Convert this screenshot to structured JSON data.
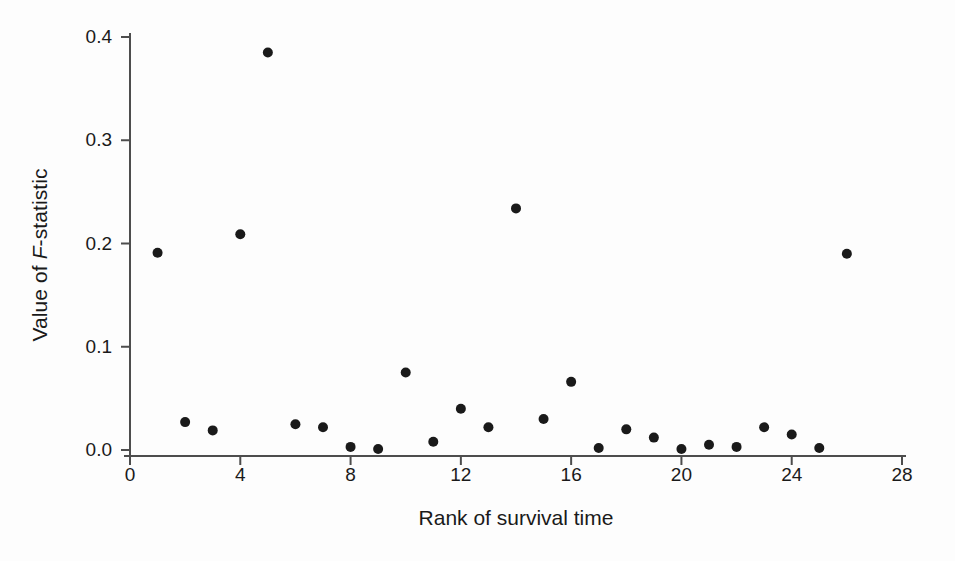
{
  "chart_data": {
    "type": "scatter",
    "title": "",
    "xlabel": "Rank of survival time",
    "ylabel": "Value of F-statistic",
    "ylabel_parts": {
      "prefix": "Value of ",
      "italic": "F",
      "suffix": "-statistic"
    },
    "xlim": [
      0,
      28
    ],
    "ylim": [
      0.0,
      0.4
    ],
    "xticks": [
      0,
      4,
      8,
      12,
      16,
      20,
      24,
      28
    ],
    "xtick_labels": [
      "0",
      "4",
      "8",
      "12",
      "16",
      "20",
      "24",
      "28"
    ],
    "yticks": [
      0.0,
      0.1,
      0.2,
      0.3,
      0.4
    ],
    "ytick_labels": [
      "0.0",
      "0.1",
      "0.2",
      "0.3",
      "0.4"
    ],
    "grid": false,
    "legend": false,
    "marker": {
      "shape": "circle",
      "color": "#1a1a1a",
      "size_px": 10
    },
    "x": [
      1,
      2,
      3,
      4,
      5,
      6,
      7,
      8,
      9,
      10,
      11,
      12,
      13,
      14,
      15,
      16,
      17,
      18,
      19,
      20,
      21,
      22,
      23,
      24,
      25,
      26
    ],
    "values": [
      0.191,
      0.027,
      0.019,
      0.209,
      0.385,
      0.025,
      0.022,
      0.003,
      0.001,
      0.075,
      0.008,
      0.04,
      0.022,
      0.234,
      0.03,
      0.066,
      0.002,
      0.02,
      0.012,
      0.001,
      0.005,
      0.003,
      0.022,
      0.015,
      0.002,
      0.19
    ],
    "points": [
      {
        "x": 1,
        "y": 0.191
      },
      {
        "x": 2,
        "y": 0.027
      },
      {
        "x": 3,
        "y": 0.019
      },
      {
        "x": 4,
        "y": 0.209
      },
      {
        "x": 5,
        "y": 0.385
      },
      {
        "x": 6,
        "y": 0.025
      },
      {
        "x": 7,
        "y": 0.022
      },
      {
        "x": 8,
        "y": 0.003
      },
      {
        "x": 9,
        "y": 0.001
      },
      {
        "x": 10,
        "y": 0.075
      },
      {
        "x": 11,
        "y": 0.008
      },
      {
        "x": 12,
        "y": 0.04
      },
      {
        "x": 13,
        "y": 0.022
      },
      {
        "x": 14,
        "y": 0.234
      },
      {
        "x": 15,
        "y": 0.03
      },
      {
        "x": 16,
        "y": 0.066
      },
      {
        "x": 17,
        "y": 0.002
      },
      {
        "x": 18,
        "y": 0.02
      },
      {
        "x": 19,
        "y": 0.012
      },
      {
        "x": 20,
        "y": 0.001
      },
      {
        "x": 21,
        "y": 0.005
      },
      {
        "x": 22,
        "y": 0.003
      },
      {
        "x": 23,
        "y": 0.022
      },
      {
        "x": 24,
        "y": 0.015
      },
      {
        "x": 25,
        "y": 0.002
      },
      {
        "x": 26,
        "y": 0.19
      }
    ]
  },
  "axes": {
    "axis_color": "#4d4d4d",
    "background": "#fdfdfd"
  }
}
